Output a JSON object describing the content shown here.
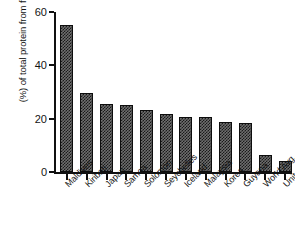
{
  "chart_data": {
    "type": "bar",
    "title": "",
    "subtitle": "",
    "xlabel": "",
    "ylabel": "(%) of total protein from fish",
    "ylim": [
      0,
      60
    ],
    "yticks": [
      0,
      20,
      40,
      60
    ],
    "ytick_labels": [
      "0",
      "20",
      "40",
      "60"
    ],
    "grid": false,
    "legend": false,
    "legend_position": "none",
    "categories": [
      "Maldives",
      "Kiribati",
      "Japan",
      "Samoa",
      "Solomon",
      "Seychelles",
      "Iceland",
      "Malaysia",
      "Korea",
      "Guyana",
      "World Avg.",
      "United State (92nd)"
    ],
    "values": [
      55,
      29.5,
      25.5,
      25.3,
      23.3,
      21.8,
      20.8,
      20.5,
      18.6,
      18.3,
      6.5,
      4
    ],
    "bar_fill": "#6e6e6e",
    "bar_pattern": "checkerboard",
    "bar_edge_color": "#0d0d0d",
    "axis_color": "#111111"
  }
}
